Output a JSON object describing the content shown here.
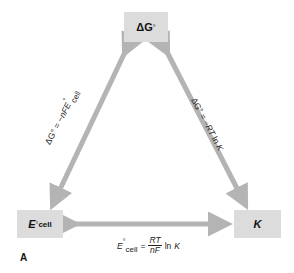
{
  "diagram": {
    "nodes": {
      "delta_g": {
        "symbol": "ΔG",
        "superscript": "°"
      },
      "e_cell": {
        "symbol": "E",
        "superscript": "°",
        "subscript": "cell"
      },
      "k": {
        "symbol": "K"
      }
    },
    "edges": {
      "left": {
        "from": "ΔG°",
        "to": "E°cell",
        "label_prefix": "ΔG° = −",
        "label_var": "nFE",
        "label_sup": "°",
        "label_sub": "cell"
      },
      "right": {
        "from": "ΔG°",
        "to": "K",
        "label_prefix": "ΔG° = −",
        "label_var": "RT",
        "label_suffix": " ln ",
        "label_k": "K"
      },
      "bottom": {
        "from": "E°cell",
        "to": "K",
        "lhs_var": "E",
        "lhs_sup": "°",
        "lhs_sub": "cell",
        "equals": "=",
        "numerator": "RT",
        "denominator": "nF",
        "suffix": "ln",
        "k": "K"
      }
    },
    "panel_label": "A",
    "colors": {
      "box_fill": "#dcdcdc",
      "arrow_fill": "#b4b4b4",
      "text": "#111111"
    }
  }
}
